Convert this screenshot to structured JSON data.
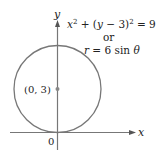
{
  "diagram": {
    "type": "polar-circle-graph",
    "axes": {
      "x_label": "x",
      "y_label": "y",
      "origin_label": "0"
    },
    "circle": {
      "center_label": "(0, 3)",
      "equation_cartesian": {
        "lhs_x": "x",
        "sup_x": "2",
        "plus": " + (",
        "lhs_y": "y",
        "minus": " − 3)",
        "sup_y": "2",
        "rhs": " = 9"
      },
      "connector": "or",
      "equation_polar": {
        "r": "r",
        "rest": " = 6 sin ",
        "theta": "θ"
      }
    },
    "colors": {
      "axis": "#777777",
      "circle": "#777777",
      "center_dot": "#888888",
      "text": "#222222"
    }
  }
}
